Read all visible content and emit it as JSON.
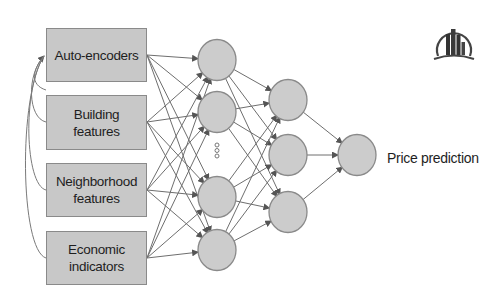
{
  "diagram": {
    "type": "neural-network",
    "inputs": [
      {
        "label": "Auto-encoders"
      },
      {
        "label": "Building\nfeatures"
      },
      {
        "label": "Neighborhood\nfeatures"
      },
      {
        "label": "Economic\nindicators"
      }
    ],
    "hidden_layer_1": {
      "visible_nodes": 4,
      "ellipsis": "..."
    },
    "hidden_layer_2": {
      "nodes": 3
    },
    "output": {
      "nodes": 1,
      "label": "Price prediction"
    },
    "logo_icon": "city-buildings-icon",
    "colors": {
      "box_fill": "#c8c8c8",
      "node_fill": "#cccccc",
      "stroke": "#8a8a8a",
      "edge": "#6e6e6e",
      "text": "#1e1e1e"
    }
  }
}
